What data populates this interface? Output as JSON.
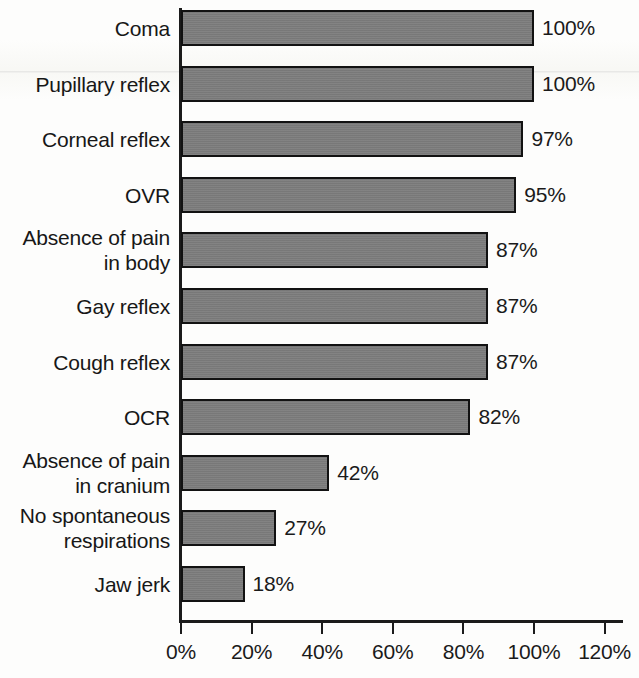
{
  "chart_data": {
    "type": "bar",
    "orientation": "horizontal",
    "title": "",
    "subtitle": "",
    "xlabel": "",
    "ylabel": "",
    "xlim": [
      0,
      120
    ],
    "grid": false,
    "legend": false,
    "unit": "%",
    "xtick_labels": [
      "0%",
      "20%",
      "40%",
      "60%",
      "80%",
      "100%",
      "120%"
    ],
    "xticks": [
      0,
      20,
      40,
      60,
      80,
      100,
      120
    ],
    "categories": [
      "Coma",
      "Pupillary reflex",
      "Corneal reflex",
      "OVR",
      "Absence of pain\nin body",
      "Gay reflex",
      "Cough reflex",
      "OCR",
      "Absence of pain\nin cranium",
      "No spontaneous\nrespirations",
      "Jaw jerk"
    ],
    "values": [
      100,
      100,
      97,
      95,
      87,
      87,
      87,
      82,
      42,
      27,
      18
    ],
    "value_labels": [
      "100%",
      "100%",
      "97%",
      "95%",
      "87%",
      "87%",
      "87%",
      "82%",
      "42%",
      "27%",
      "18%"
    ],
    "colors": {
      "bar_fill": "#7c7c7c",
      "bar_border": "#121212",
      "axis": "#1b1b1b",
      "text": "#1a1a1a",
      "background": "#fdfdfc"
    }
  }
}
